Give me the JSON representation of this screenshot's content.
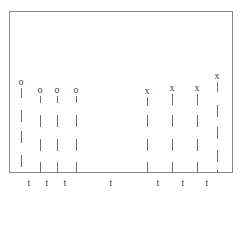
{
  "figure": {
    "frame": {
      "left": 9,
      "top": 11,
      "right": 233,
      "bottom": 173
    },
    "lines": [
      {
        "id": "o1",
        "marker": "o",
        "x": 21,
        "top": 86,
        "dashes": [
          [
            88,
            98
          ],
          [
            110,
            122
          ],
          [
            131,
            143
          ],
          [
            155,
            167
          ]
        ]
      },
      {
        "id": "o2",
        "marker": "o",
        "x": 40,
        "top": 94,
        "dashes": [
          [
            96,
            103
          ],
          [
            115,
            127
          ],
          [
            139,
            151
          ],
          [
            162,
            173
          ]
        ]
      },
      {
        "id": "o3",
        "marker": "o",
        "x": 57,
        "top": 94,
        "dashes": [
          [
            96,
            103
          ],
          [
            115,
            127
          ],
          [
            139,
            151
          ],
          [
            162,
            173
          ]
        ]
      },
      {
        "id": "o4",
        "marker": "o",
        "x": 76,
        "top": 94,
        "dashes": [
          [
            96,
            103
          ],
          [
            115,
            127
          ],
          [
            139,
            151
          ],
          [
            162,
            173
          ]
        ]
      },
      {
        "id": "x1",
        "marker": "x",
        "x": 147,
        "top": 95,
        "dashes": [
          [
            97,
            106
          ],
          [
            115,
            127
          ],
          [
            139,
            151
          ],
          [
            162,
            173
          ]
        ]
      },
      {
        "id": "x2",
        "marker": "x",
        "x": 172,
        "top": 92,
        "dashes": [
          [
            94,
            105
          ],
          [
            115,
            127
          ],
          [
            139,
            151
          ],
          [
            162,
            173
          ]
        ]
      },
      {
        "id": "x3",
        "marker": "x",
        "x": 197,
        "top": 92,
        "dashes": [
          [
            94,
            105
          ],
          [
            115,
            127
          ],
          [
            139,
            151
          ],
          [
            162,
            172
          ]
        ]
      },
      {
        "id": "x4",
        "marker": "x",
        "x": 217,
        "top": 80,
        "dashes": [
          [
            82,
            92
          ],
          [
            105,
            117
          ],
          [
            127,
            139
          ],
          [
            150,
            162
          ],
          [
            170,
            173
          ]
        ]
      }
    ],
    "t_labels": [
      {
        "text": "t",
        "x": 29
      },
      {
        "text": "t",
        "x": 47
      },
      {
        "text": "t",
        "x": 65
      },
      {
        "text": "t",
        "x": 111
      },
      {
        "text": "t",
        "x": 158
      },
      {
        "text": "t",
        "x": 183
      },
      {
        "text": "t",
        "x": 207
      }
    ],
    "colors": {
      "frame": "#8a8a8a",
      "dash": "#6e6e6e",
      "text": "#444444"
    }
  }
}
